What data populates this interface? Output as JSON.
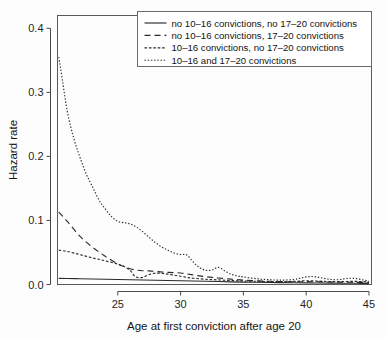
{
  "figure": {
    "background_color": "#fdfdfd",
    "line_color": "#2b2b2b",
    "frame_color": "#5a5a5a"
  },
  "chart_data": {
    "type": "line",
    "title": "",
    "xlabel": "Age at first conviction after age 20",
    "ylabel": "Hazard rate",
    "xlim": [
      20.2,
      45.2
    ],
    "ylim": [
      0.0,
      0.42
    ],
    "xticks": [
      25,
      30,
      35,
      40,
      45
    ],
    "xticklabels": [
      "25",
      "30",
      "35",
      "40",
      "45"
    ],
    "yticks": [
      0.0,
      0.1,
      0.2,
      0.3,
      0.4
    ],
    "yticklabels": [
      "0.0",
      "0.1",
      "0.2",
      "0.3",
      "0.4"
    ],
    "grid": false,
    "legend_position": "top-right",
    "series": [
      {
        "name": "no 10-16 convictions, no 17-20 convictions",
        "label": "no 10–16 convictions, no 17–20 convictions",
        "dash": "none",
        "dasharray": "",
        "x": [
          20.3,
          21,
          22,
          23,
          24,
          25,
          26,
          27,
          28,
          29,
          30,
          31,
          32,
          33,
          34,
          35,
          36,
          37,
          38,
          39,
          40,
          41,
          42,
          43,
          44,
          45
        ],
        "y": [
          0.0095,
          0.0093,
          0.009,
          0.0086,
          0.0082,
          0.0078,
          0.0074,
          0.007,
          0.0066,
          0.0062,
          0.0058,
          0.0054,
          0.005,
          0.0046,
          0.0042,
          0.0038,
          0.0035,
          0.0032,
          0.0029,
          0.0027,
          0.0025,
          0.0023,
          0.0021,
          0.002,
          0.0019,
          0.0018
        ]
      },
      {
        "name": "no 10-16 convictions, 17-20 convictions",
        "label": "no 10–16 convictions, 17–20 convictions",
        "dash": "dashed",
        "dasharray": "6,4",
        "x": [
          20.3,
          21,
          22,
          23,
          24,
          25,
          25.5,
          26,
          26.5,
          27,
          27.5,
          28,
          28.5,
          29,
          29.5,
          30,
          30.5,
          31,
          31.5,
          32,
          32.5,
          33,
          34,
          35,
          36,
          37,
          38,
          39,
          40,
          41,
          42,
          43,
          44,
          45
        ],
        "y": [
          0.113,
          0.098,
          0.075,
          0.058,
          0.044,
          0.032,
          0.028,
          0.0245,
          0.0225,
          0.0215,
          0.0212,
          0.0205,
          0.0195,
          0.019,
          0.0185,
          0.018,
          0.0165,
          0.0148,
          0.0135,
          0.0122,
          0.0112,
          0.0102,
          0.0085,
          0.0068,
          0.0058,
          0.005,
          0.0044,
          0.0042,
          0.0044,
          0.0042,
          0.0038,
          0.0036,
          0.0034,
          0.0032
        ]
      },
      {
        "name": "10-16 convictions, no 17-20 convictions",
        "label": "10–16 convictions, no 17–20 convictions",
        "dash": "fine-dashed",
        "dasharray": "2.6,1.8",
        "x": [
          20.3,
          21,
          22,
          23,
          24,
          25,
          25.5,
          26,
          26.3,
          26.6,
          27,
          27.4,
          27.8,
          28.2,
          28.6,
          29,
          29.5,
          30,
          30.5,
          31,
          32,
          33,
          34,
          35,
          36,
          37,
          38,
          39,
          40,
          41,
          42,
          43,
          44,
          45
        ],
        "y": [
          0.0535,
          0.0515,
          0.0465,
          0.0415,
          0.037,
          0.0318,
          0.0282,
          0.0218,
          0.0138,
          0.0108,
          0.0112,
          0.0148,
          0.0172,
          0.0178,
          0.0172,
          0.0162,
          0.0145,
          0.0128,
          0.0112,
          0.0098,
          0.0082,
          0.0072,
          0.0062,
          0.0055,
          0.005,
          0.0046,
          0.0044,
          0.0048,
          0.0058,
          0.0052,
          0.0044,
          0.0046,
          0.0048,
          0.004
        ]
      },
      {
        "name": "10-16 and 17-20 convictions",
        "label": "10–16 and 17–20 convictions",
        "dash": "dotted",
        "dasharray": "1.4,1.8",
        "x": [
          20.3,
          20.6,
          21,
          21.5,
          22,
          22.5,
          23,
          23.5,
          24,
          24.5,
          25,
          25.5,
          26,
          26.5,
          27,
          27.5,
          28,
          28.5,
          29,
          29.5,
          30,
          30.5,
          31,
          31.5,
          32,
          32.5,
          33,
          33.5,
          34,
          34.5,
          35,
          36,
          37,
          38,
          39,
          39.5,
          40,
          40.5,
          41,
          41.5,
          42,
          42.5,
          43,
          43.5,
          44,
          44.5,
          45
        ],
        "y": [
          0.355,
          0.318,
          0.268,
          0.228,
          0.198,
          0.172,
          0.152,
          0.132,
          0.118,
          0.106,
          0.0985,
          0.0965,
          0.0945,
          0.0895,
          0.0822,
          0.0735,
          0.0655,
          0.0585,
          0.0535,
          0.049,
          0.0468,
          0.0462,
          0.0352,
          0.0265,
          0.0222,
          0.0225,
          0.0268,
          0.0215,
          0.0162,
          0.0135,
          0.0118,
          0.0092,
          0.0075,
          0.0068,
          0.0078,
          0.0098,
          0.0118,
          0.0125,
          0.0112,
          0.0092,
          0.0078,
          0.0075,
          0.0088,
          0.0098,
          0.0092,
          0.0072,
          0.0052
        ]
      }
    ]
  }
}
